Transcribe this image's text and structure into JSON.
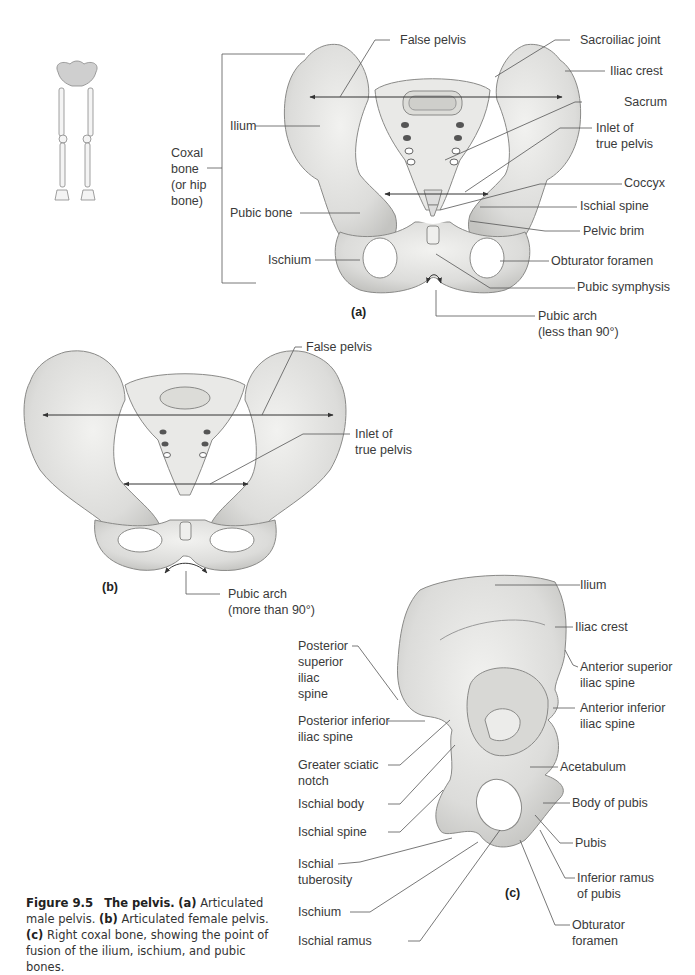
{
  "figure": {
    "number": "Figure 9.5",
    "title": "The pelvis.",
    "caption_parts": [
      {
        "marker": "(a)",
        "text": "Articulated male pelvis."
      },
      {
        "marker": "(b)",
        "text": "Articulated female pelvis."
      },
      {
        "marker": "(c)",
        "text": "Right coxal bone, showing the point of fusion of the ilium, ischium, and pubic bones."
      }
    ]
  },
  "panel_a": {
    "letter": "(a)",
    "bracket_label": [
      "Coxal",
      "bone",
      "(or hip",
      "bone)"
    ],
    "labels_left": [
      "Ilium",
      "Pubic bone",
      "Ischium"
    ],
    "labels_right": {
      "false_pelvis": "False pelvis",
      "sacroiliac_joint": "Sacroiliac joint",
      "iliac_crest": "Iliac crest",
      "sacrum": "Sacrum",
      "inlet_1": "Inlet of",
      "inlet_2": "true pelvis",
      "coccyx": "Coccyx",
      "ischial_spine": "Ischial spine",
      "pelvic_brim": "Pelvic brim",
      "obturator_foramen": "Obturator foramen",
      "pubic_symphysis": "Pubic symphysis",
      "pubic_arch_1": "Pubic arch",
      "pubic_arch_2": "(less than 90°)"
    }
  },
  "panel_b": {
    "letter": "(b)",
    "false_pelvis": "False pelvis",
    "inlet_1": "Inlet of",
    "inlet_2": "true pelvis",
    "pubic_arch_1": "Pubic arch",
    "pubic_arch_2": "(more than 90°)"
  },
  "panel_c": {
    "letter": "(c)",
    "left_labels": {
      "psis": [
        "Posterior",
        "superior",
        "iliac",
        "spine"
      ],
      "piis": [
        "Posterior inferior",
        "iliac spine"
      ],
      "gsn": [
        "Greater sciatic",
        "notch"
      ],
      "ischial_body": "Ischial body",
      "ischial_spine": "Ischial spine",
      "ischial_tuberosity": [
        "Ischial",
        "tuberosity"
      ],
      "ischium": "Ischium",
      "ischial_ramus": "Ischial ramus"
    },
    "right_labels": {
      "ilium": "Ilium",
      "iliac_crest": "Iliac crest",
      "asis": [
        "Anterior superior",
        "iliac spine"
      ],
      "aiis": [
        "Anterior inferior",
        "iliac spine"
      ],
      "acetabulum": "Acetabulum",
      "body_of_pubis": "Body of pubis",
      "pubis": "Pubis",
      "inferior_ramus": [
        "Inferior ramus",
        "of pubis"
      ],
      "obturator_foramen": [
        "Obturator",
        "foramen"
      ]
    }
  },
  "colors": {
    "bone_fill": "#e4e4e2",
    "bone_shade": "#c9c9c6",
    "bone_outline": "#8a8a88",
    "leader_line": "#555555",
    "text": "#3a3a3a"
  }
}
